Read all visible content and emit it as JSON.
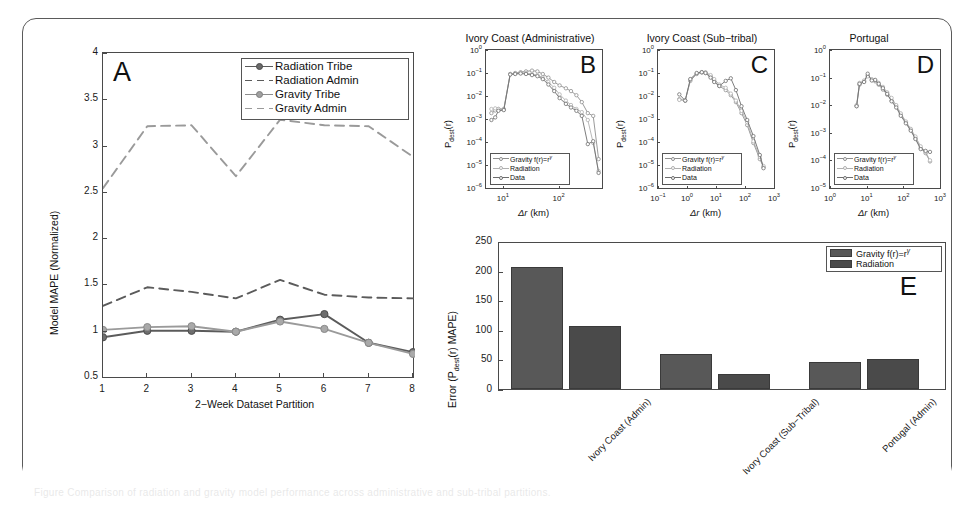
{
  "figure": {
    "background": "#ffffff",
    "frame_color": "#5a5a5a",
    "caption_ghost": "Figure  Comparison of radiation and gravity model performance across administrative and sub-tribal partitions."
  },
  "palette": {
    "radiation_tribe": "#5b5b5b",
    "radiation_admin": "#5b5b5b",
    "gravity_tribe": "#9a9a9a",
    "gravity_admin": "#9a9a9a",
    "bar_gravity": "#585858",
    "bar_radiation": "#4a4a4a",
    "axis": "#4a4a4a",
    "text": "#1a1a1a"
  },
  "panelA": {
    "letter": "A",
    "xlabel": "2−Week Dataset Partition",
    "ylabel": "Model MAPE (Normalized)",
    "xticks": [
      "1",
      "2",
      "3",
      "4",
      "5",
      "6",
      "7",
      "8"
    ],
    "yticks": [
      "0.5",
      "1",
      "1.5",
      "2",
      "2.5",
      "3",
      "3.5",
      "4"
    ],
    "legend": [
      {
        "label": "Radiation Tribe",
        "style": "solid-marker",
        "tone": "dark"
      },
      {
        "label": "Radiation Admin",
        "style": "dashed",
        "tone": "dark"
      },
      {
        "label": "Gravity Tribe",
        "style": "solid-marker",
        "tone": "light"
      },
      {
        "label": "Gravity Admin",
        "style": "dashed",
        "tone": "light"
      }
    ]
  },
  "panelB": {
    "letter": "B",
    "title": "Ivory Coast (Administrative)"
  },
  "panelC": {
    "letter": "C",
    "title": "Ivory Coast (Sub−tribal)"
  },
  "panelD": {
    "letter": "D",
    "title": "Portugal"
  },
  "small_panels_common": {
    "ylabel_main": "P",
    "ylabel_sub": "dest",
    "ylabel_tail": "(r)",
    "xlabel_delta": "Δr",
    "xlabel_unit": " (km)",
    "yticks": [
      "10⁰",
      "10⁻¹",
      "10⁻²",
      "10⁻³",
      "10⁻⁴",
      "10⁻⁵",
      "10⁻⁶"
    ],
    "legend": [
      {
        "label_main": "Gravity f(r)=r",
        "label_sup": "γ"
      },
      {
        "label_main": "Radiation",
        "label_sup": ""
      },
      {
        "label_main": "Data",
        "label_sup": ""
      }
    ]
  },
  "panelE": {
    "letter": "E",
    "ylabel_main": "Error (P",
    "ylabel_sub": "dest",
    "ylabel_tail": "(r) MAPE)",
    "yticks": [
      "0",
      "50",
      "100",
      "150",
      "200",
      "250"
    ],
    "legend": [
      {
        "label_main": "Gravity f(r)=r",
        "label_sup": "γ",
        "color": "#585858"
      },
      {
        "label_main": "Radiation",
        "label_sup": "",
        "color": "#4a4a4a"
      }
    ]
  },
  "chart_data": [
    {
      "id": "panel-a",
      "type": "line",
      "title": "A",
      "xlabel": "2-Week Dataset Partition",
      "ylabel": "Model MAPE (Normalized)",
      "x": [
        1,
        2,
        3,
        4,
        5,
        6,
        7,
        8
      ],
      "xlim": [
        1,
        8
      ],
      "ylim": [
        0.5,
        4
      ],
      "grid": false,
      "legend_position": "top-right",
      "series": [
        {
          "name": "Radiation Tribe",
          "style": "solid",
          "marker": "circle",
          "values": [
            0.94,
            1.01,
            1.01,
            1.0,
            1.13,
            1.19,
            0.88,
            0.78
          ]
        },
        {
          "name": "Radiation Admin",
          "style": "dashed",
          "marker": "none",
          "values": [
            1.28,
            1.48,
            1.43,
            1.36,
            1.56,
            1.4,
            1.37,
            1.36
          ]
        },
        {
          "name": "Gravity Tribe",
          "style": "solid",
          "marker": "circle",
          "values": [
            1.02,
            1.05,
            1.06,
            1.0,
            1.11,
            1.03,
            0.88,
            0.76
          ]
        },
        {
          "name": "Gravity Admin",
          "style": "dashed",
          "marker": "none",
          "values": [
            2.55,
            3.22,
            3.23,
            2.68,
            3.29,
            3.23,
            3.22,
            2.89
          ]
        }
      ]
    },
    {
      "id": "panel-b",
      "type": "line",
      "title": "Ivory Coast (Administrative)",
      "xlabel": "Δr (km)",
      "ylabel": "P_dest(r)",
      "xscale": "log",
      "yscale": "log",
      "xlim": [
        5,
        600
      ],
      "ylim": [
        1e-06,
        1
      ],
      "xticks": [
        10,
        100
      ],
      "legend_position": "bottom-left",
      "series": [
        {
          "name": "Gravity f(r)=r^γ",
          "x": [
            6,
            7,
            8,
            10,
            13,
            16,
            20,
            25,
            32,
            40,
            50,
            63,
            80,
            100,
            130,
            160,
            200,
            250,
            320,
            400,
            500
          ],
          "y": [
            0.002,
            0.0026,
            0.003,
            0.003,
            0.1,
            0.11,
            0.12,
            0.13,
            0.14,
            0.13,
            0.1,
            0.07,
            0.045,
            0.032,
            0.024,
            0.018,
            0.012,
            0.006,
            0.002,
            0.0015,
            2e-05
          ]
        },
        {
          "name": "Radiation",
          "x": [
            6,
            7,
            8,
            10,
            13,
            16,
            20,
            25,
            32,
            40,
            50,
            63,
            80,
            100,
            130,
            160,
            200,
            250,
            320,
            400,
            500
          ],
          "y": [
            0.003,
            0.0032,
            0.003,
            0.0028,
            0.1,
            0.105,
            0.11,
            0.11,
            0.1,
            0.09,
            0.07,
            0.045,
            0.025,
            0.013,
            0.007,
            0.0045,
            0.003,
            0.0022,
            0.001,
            0.0001,
            6e-06
          ]
        },
        {
          "name": "Data",
          "x": [
            6,
            7,
            8,
            10,
            13,
            16,
            20,
            25,
            32,
            40,
            50,
            63,
            80,
            100,
            130,
            160,
            200,
            250,
            320,
            400,
            500
          ],
          "y": [
            0.001,
            0.0013,
            0.0025,
            0.0027,
            0.095,
            0.1,
            0.105,
            0.1,
            0.09,
            0.08,
            0.06,
            0.035,
            0.018,
            0.009,
            0.005,
            0.0035,
            0.0025,
            0.0015,
            9e-05,
            0.00012,
            5e-06
          ]
        }
      ]
    },
    {
      "id": "panel-c",
      "type": "line",
      "title": "Ivory Coast (Sub-tribal)",
      "xlabel": "Δr (km)",
      "ylabel": "P_dest(r)",
      "xscale": "log",
      "yscale": "log",
      "xlim": [
        0.1,
        1000
      ],
      "ylim": [
        1e-06,
        1
      ],
      "xticks": [
        0.1,
        1,
        10,
        100,
        1000
      ],
      "legend_position": "bottom-left",
      "series": [
        {
          "name": "Gravity f(r)=r^γ",
          "x": [
            0.5,
            0.8,
            1.2,
            2,
            3,
            4,
            6,
            8,
            12,
            20,
            30,
            45,
            70,
            110,
            180,
            300,
            400
          ],
          "y": [
            0.008,
            0.007,
            0.05,
            0.1,
            0.12,
            0.11,
            0.08,
            0.05,
            0.03,
            0.02,
            0.012,
            0.006,
            0.002,
            0.0006,
            0.0001,
            2e-05,
            9e-06
          ]
        },
        {
          "name": "Radiation",
          "x": [
            0.5,
            0.8,
            1.2,
            2,
            3,
            4,
            6,
            8,
            12,
            20,
            30,
            45,
            70,
            110,
            180,
            300,
            400
          ],
          "y": [
            0.0075,
            0.007,
            0.055,
            0.105,
            0.115,
            0.12,
            0.09,
            0.06,
            0.035,
            0.025,
            0.014,
            0.007,
            0.0025,
            0.0008,
            0.00012,
            2.5e-05,
            1e-05
          ]
        },
        {
          "name": "Data",
          "x": [
            0.5,
            0.8,
            1.2,
            2,
            3,
            4,
            6,
            8,
            12,
            20,
            30,
            45,
            70,
            110,
            180,
            300,
            400
          ],
          "y": [
            0.013,
            0.007,
            0.06,
            0.11,
            0.12,
            0.11,
            0.07,
            0.045,
            0.03,
            0.05,
            0.065,
            0.02,
            0.004,
            0.001,
            0.0002,
            3e-05,
            8e-06
          ]
        }
      ]
    },
    {
      "id": "panel-d",
      "type": "line",
      "title": "Portugal",
      "xlabel": "Δr (km)",
      "ylabel": "P_dest(r)",
      "xscale": "log",
      "yscale": "log",
      "xlim": [
        1,
        1000
      ],
      "ylim": [
        1e-05,
        1
      ],
      "xticks": [
        1,
        10,
        100,
        1000
      ],
      "legend_position": "bottom-left",
      "series": [
        {
          "name": "Gravity f(r)=r^γ",
          "x": [
            5,
            6,
            8,
            10,
            13,
            16,
            20,
            26,
            34,
            45,
            60,
            80,
            110,
            150,
            200,
            280,
            380,
            500
          ],
          "y": [
            0.01,
            0.06,
            0.08,
            0.13,
            0.09,
            0.08,
            0.06,
            0.04,
            0.026,
            0.016,
            0.01,
            0.005,
            0.0026,
            0.0014,
            0.0007,
            0.0003,
            0.0002,
            0.0001
          ]
        },
        {
          "name": "Radiation",
          "x": [
            5,
            6,
            8,
            10,
            13,
            16,
            20,
            26,
            34,
            45,
            60,
            80,
            110,
            150,
            200,
            280,
            380,
            500
          ],
          "y": [
            0.011,
            0.07,
            0.085,
            0.12,
            0.095,
            0.085,
            0.07,
            0.05,
            0.032,
            0.02,
            0.011,
            0.0055,
            0.0028,
            0.0015,
            0.0008,
            0.00035,
            0.00022,
            0.00011
          ]
        },
        {
          "name": "Data",
          "x": [
            5,
            6,
            8,
            10,
            13,
            16,
            20,
            26,
            34,
            45,
            60,
            80,
            110,
            150,
            200,
            280,
            380,
            500
          ],
          "y": [
            0.01,
            0.065,
            0.075,
            0.15,
            0.085,
            0.09,
            0.065,
            0.045,
            0.028,
            0.015,
            0.009,
            0.0045,
            0.0024,
            0.0013,
            0.00065,
            0.00028,
            0.00024,
            0.00022
          ]
        }
      ]
    },
    {
      "id": "panel-e",
      "type": "bar",
      "title": "E",
      "xlabel": "",
      "ylabel": "Error (P_dest(r) MAPE)",
      "ylim": [
        0,
        250
      ],
      "yticks": [
        0,
        50,
        100,
        150,
        200,
        250
      ],
      "categories": [
        "Ivory Coast (Admin)",
        "Ivory Coast (Sub−Tribal)",
        "Portugal (Admin)"
      ],
      "legend_position": "top-right",
      "series": [
        {
          "name": "Gravity f(r)=r^γ",
          "color": "#585858",
          "values": [
            207,
            60,
            46
          ]
        },
        {
          "name": "Radiation",
          "color": "#4a4a4a",
          "values": [
            106,
            26,
            51
          ]
        }
      ]
    }
  ]
}
